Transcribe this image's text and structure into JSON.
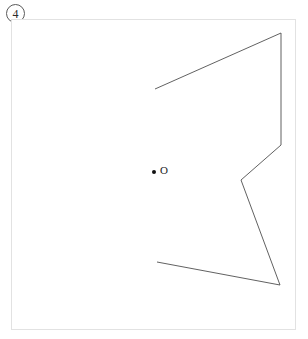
{
  "figure": {
    "problem_number": "4",
    "frame": {
      "x": 11,
      "y": 19,
      "width": 285,
      "height": 311,
      "border_color": "#e2e2e2"
    },
    "stroke_color": "#4f4f4f",
    "point_color": "#111111",
    "point": {
      "name": "O",
      "label": "O",
      "x": 154,
      "y": 172,
      "radius": 2.0
    },
    "label_position": {
      "x": 160,
      "y": 165
    },
    "polyline": {
      "name": "open-polyline",
      "closed": false,
      "points": [
        {
          "x": 155,
          "y": 89
        },
        {
          "x": 281,
          "y": 33
        },
        {
          "x": 281,
          "y": 145
        },
        {
          "x": 241,
          "y": 180
        },
        {
          "x": 280,
          "y": 285
        },
        {
          "x": 157,
          "y": 262
        }
      ],
      "points_svg": "155,89 281,33 281,145 241,180 280,285 157,262"
    }
  }
}
